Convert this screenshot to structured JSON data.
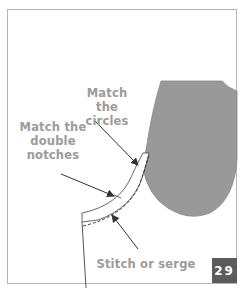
{
  "figure": {
    "labels": {
      "circles": [
        "Match the",
        "circles"
      ],
      "double_notches": [
        "Match the",
        "double",
        "notches"
      ],
      "stitch": "Stitch or serge"
    },
    "step_number": "29",
    "colors": {
      "border": "#b5b5b5",
      "fabric_fill": "#999999",
      "label_text": "#9b9b9b",
      "badge_bg": "#5b5b5b",
      "arrow": "#333333"
    }
  }
}
